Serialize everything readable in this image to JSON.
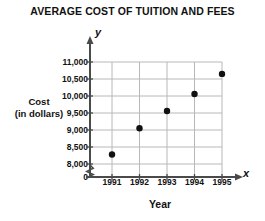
{
  "chart_data": {
    "type": "scatter",
    "title": "AVERAGE COST OF TUITION AND FEES",
    "xlabel": "Year",
    "ylabel": "Cost (in dollars)",
    "ylabel_line1": "Cost",
    "ylabel_line2": "(in dollars)",
    "x_axis_letter": "x",
    "y_axis_letter": "y",
    "categories": [
      1991,
      1992,
      1993,
      1994,
      1995
    ],
    "x_tick_labels": [
      "1991",
      "1992",
      "1993",
      "1994",
      "1995"
    ],
    "values": [
      8280,
      9050,
      9560,
      10060,
      10650
    ],
    "y_tick_values": [
      8000,
      8500,
      9000,
      9500,
      10000,
      10500,
      11000
    ],
    "y_tick_labels": [
      "8,000",
      "8,500",
      "9,000",
      "9,500",
      "10,000",
      "10,500",
      "11,000"
    ],
    "y_origin_label": "0",
    "ylim": [
      8000,
      11000
    ],
    "xlim": [
      1990.5,
      1995.5
    ],
    "grid": true,
    "legend": "none",
    "axis_break": "zigzag between 0 and 8,000 on y-axis",
    "point_color": "#111111",
    "grid_color": "#b8b8b8",
    "axis_color": "#4a4a4a",
    "background_color": "#ffffff",
    "points": [
      {
        "year": "1991",
        "cost": 8280,
        "label": "8,280"
      },
      {
        "year": "1992",
        "cost": 9050,
        "label": "9,050"
      },
      {
        "year": "1993",
        "cost": 9560,
        "label": "9,560"
      },
      {
        "year": "1994",
        "cost": 10060,
        "label": "10,060"
      },
      {
        "year": "1995",
        "cost": 10650,
        "label": "10,650"
      }
    ]
  }
}
